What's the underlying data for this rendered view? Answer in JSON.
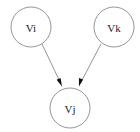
{
  "diagram": {
    "title": "",
    "background_color": "#ffffff",
    "node_stroke_color": "#8a8a8a",
    "node_fill_color": "#ffffff",
    "edge_color": "#8a8a8a",
    "arrowhead_color": "#111111",
    "label_color": "#1a1a1a",
    "nodes": [
      {
        "id": "vi",
        "label": "Vi",
        "cx": 31,
        "cy": 27,
        "r": 20
      },
      {
        "id": "vk",
        "label": "Vk",
        "cx": 114,
        "cy": 27,
        "r": 20
      },
      {
        "id": "vj",
        "label": "Vj",
        "cx": 70,
        "cy": 108,
        "r": 20
      }
    ],
    "edges": [
      {
        "id": "vi-vj",
        "from": "Vi",
        "to": "Vj",
        "directed": true,
        "x1": 42,
        "y1": 44,
        "x2": 61,
        "y2": 85
      },
      {
        "id": "vk-vj",
        "from": "Vk",
        "to": "Vj",
        "directed": true,
        "x1": 101,
        "y1": 44,
        "x2": 80,
        "y2": 85
      }
    ]
  }
}
